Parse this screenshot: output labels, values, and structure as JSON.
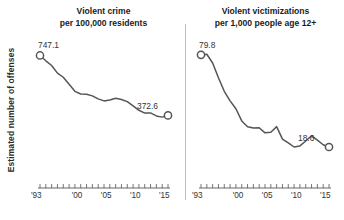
{
  "figure": {
    "ylabel": "Estimated number of offenses",
    "background": "#ffffff",
    "line_color": "#555555",
    "marker_color": "#555555",
    "divider_color": "#bfbfbf"
  },
  "chart_data": [
    {
      "type": "line",
      "title": "Violent crime\nper 100,000 residents",
      "title_line1": "Violent crime",
      "title_line2": "per 100,000 residents",
      "xlabel": "",
      "ylabel": "Estimated number of offenses",
      "xlim": [
        1993,
        2015
      ],
      "ylim": [
        0,
        800
      ],
      "grid": false,
      "legend": "none",
      "tick_labels_x": [
        "'93",
        "'00",
        "'05",
        "'10",
        "'15"
      ],
      "tick_values_x": [
        1993,
        2000,
        2005,
        2010,
        2015
      ],
      "minor_ticks_x": [
        1993,
        1994,
        1995,
        1996,
        1997,
        1998,
        1999,
        2000,
        2001,
        2002,
        2003,
        2004,
        2005,
        2006,
        2007,
        2008,
        2009,
        2010,
        2011,
        2012,
        2013,
        2014,
        2015
      ],
      "annotations": [
        {
          "text": "747.1",
          "x": 1993,
          "y": 747.1
        },
        {
          "text": "372.6",
          "x": 2015,
          "y": 372.6
        }
      ],
      "markers_at": [
        1993,
        2015
      ],
      "x": [
        1993,
        1994,
        1995,
        1996,
        1997,
        1998,
        1999,
        2000,
        2001,
        2002,
        2003,
        2004,
        2005,
        2006,
        2007,
        2008,
        2009,
        2010,
        2011,
        2012,
        2013,
        2014,
        2015
      ],
      "values": [
        747.1,
        713.6,
        684.5,
        636.6,
        611.0,
        567.6,
        523.0,
        506.5,
        504.5,
        494.4,
        475.8,
        463.2,
        469.0,
        479.3,
        471.8,
        458.6,
        431.9,
        404.5,
        387.1,
        387.8,
        369.1,
        361.6,
        372.6
      ]
    },
    {
      "type": "line",
      "title": "Violent victimizations\nper 1,000 people age 12+",
      "title_line1": "Violent victimizations",
      "title_line2": "per 1,000 people age 12+",
      "xlabel": "",
      "ylabel": "",
      "xlim": [
        1993,
        2015
      ],
      "ylim": [
        0,
        85
      ],
      "grid": false,
      "legend": "none",
      "tick_labels_x": [
        "'93",
        "'00",
        "'05",
        "'10",
        "'15"
      ],
      "tick_values_x": [
        1993,
        2000,
        2005,
        2010,
        2015
      ],
      "minor_ticks_x": [
        1993,
        1994,
        1995,
        1996,
        1997,
        1998,
        1999,
        2000,
        2001,
        2002,
        2003,
        2004,
        2005,
        2006,
        2007,
        2008,
        2009,
        2010,
        2011,
        2012,
        2013,
        2014,
        2015
      ],
      "annotations": [
        {
          "text": "79.8",
          "x": 1993,
          "y": 79.8
        },
        {
          "text": "18.6",
          "x": 2015,
          "y": 18.6
        }
      ],
      "markers_at": [
        1993,
        2015
      ],
      "x": [
        1993,
        1994,
        1995,
        1996,
        1997,
        1998,
        1999,
        2000,
        2001,
        2002,
        2003,
        2004,
        2005,
        2006,
        2007,
        2008,
        2009,
        2010,
        2011,
        2012,
        2013,
        2014,
        2015
      ],
      "values": [
        79.8,
        80.2,
        74.4,
        64.6,
        55.6,
        49.2,
        44.0,
        35.9,
        32.1,
        31.2,
        31.4,
        28.0,
        28.4,
        32.1,
        23.8,
        21.3,
        18.6,
        19.3,
        22.6,
        26.1,
        23.2,
        20.1,
        18.6
      ]
    }
  ]
}
